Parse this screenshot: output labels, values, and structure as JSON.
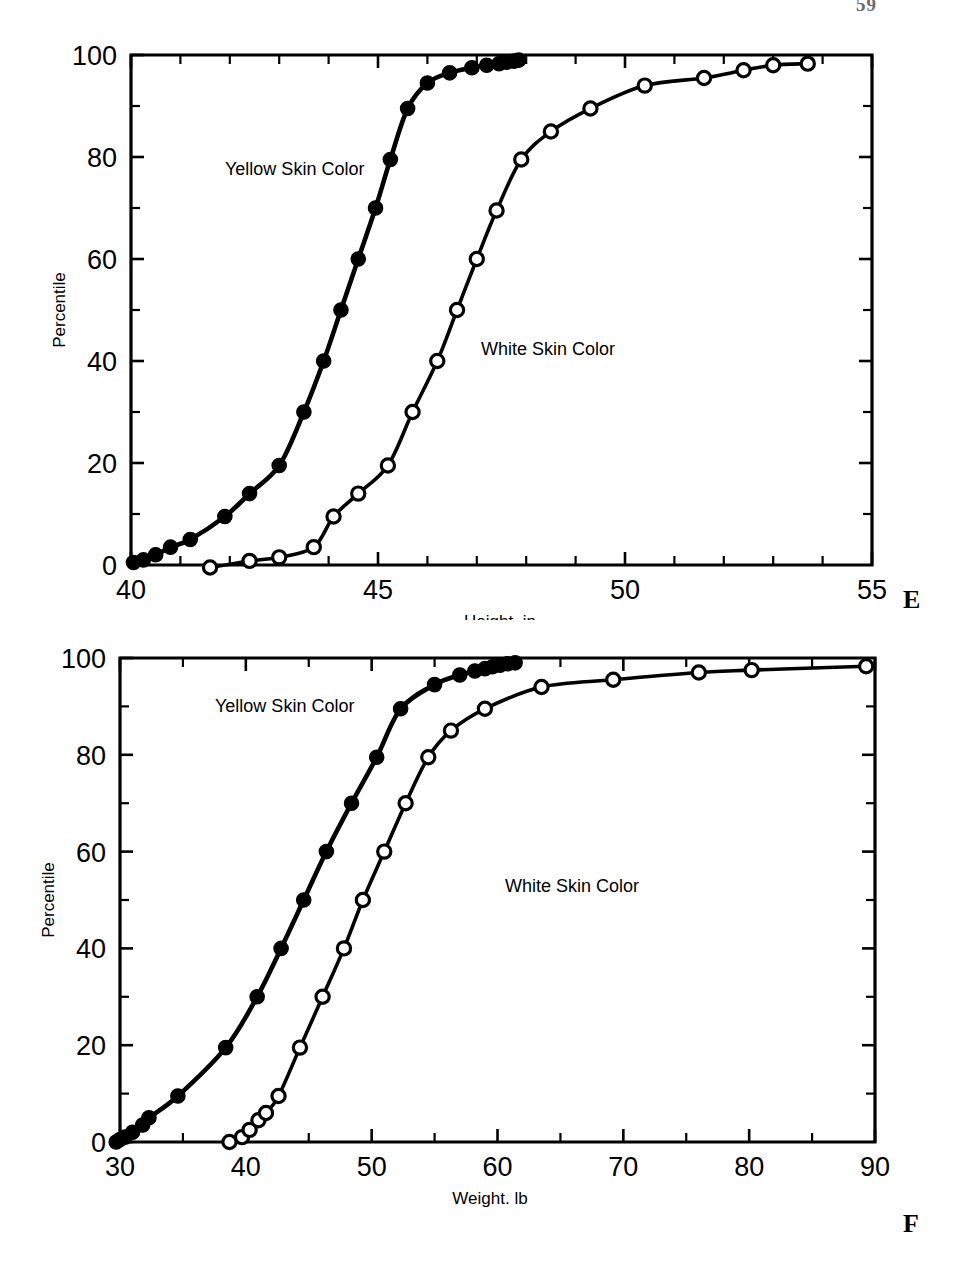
{
  "page": {
    "number": "59",
    "background": "#ffffff",
    "ink": "#000000"
  },
  "panels": [
    {
      "letter": "E",
      "axis_title_x": "Height, in",
      "axis_title_y": "Percentile",
      "label_yellow": "Yellow Skin Color",
      "label_white": "White Skin Color"
    },
    {
      "letter": "F",
      "axis_title_x": "Weight. lb",
      "axis_title_y": "Percentile",
      "label_yellow": "Yellow Skin Color",
      "label_white": "White Skin Color"
    }
  ],
  "chart_data": [
    {
      "type": "line",
      "title": "",
      "panel": "E",
      "xlabel": "Height, in",
      "ylabel": "Percentile",
      "xlim": [
        40,
        55
      ],
      "ylim": [
        0,
        100
      ],
      "xticks": [
        40,
        45,
        50,
        55
      ],
      "xtick_labels": [
        "40",
        "45",
        "50",
        "55"
      ],
      "x_minor_step": 1,
      "yticks": [
        0,
        20,
        40,
        60,
        80,
        100
      ],
      "ytick_labels": [
        "0",
        "20",
        "40",
        "60",
        "80",
        "100"
      ],
      "y_minor_step": 10,
      "grid": false,
      "legend_position": "inline-annotation",
      "series": [
        {
          "name": "Yellow Skin Color",
          "marker": "filled-circle",
          "x": [
            40.05,
            40.25,
            40.5,
            40.8,
            41.2,
            41.9,
            42.4,
            43.0,
            43.5,
            43.9,
            44.25,
            44.6,
            44.95,
            45.25,
            45.6,
            46.0,
            46.45,
            46.9,
            47.2,
            47.45,
            47.6,
            47.75,
            47.85
          ],
          "y": [
            0.5,
            1,
            2,
            3.5,
            5,
            9.5,
            14,
            19.5,
            30,
            40,
            50,
            60,
            70,
            79.5,
            89.5,
            94.5,
            96.5,
            97.5,
            98,
            98.3,
            98.6,
            98.8,
            99
          ]
        },
        {
          "name": "White Skin Color",
          "marker": "open-circle",
          "x": [
            41.6,
            42.4,
            43.0,
            43.7,
            44.1,
            44.6,
            45.2,
            45.7,
            46.2,
            46.6,
            47.0,
            47.4,
            47.9,
            48.5,
            49.3,
            50.4,
            51.6,
            52.4,
            53.0,
            53.7
          ],
          "y": [
            -0.5,
            0.8,
            1.5,
            3.5,
            9.5,
            14,
            19.5,
            30,
            40,
            50,
            60,
            69.5,
            79.5,
            85,
            89.5,
            94,
            95.5,
            97,
            98,
            98.3
          ]
        }
      ]
    },
    {
      "type": "line",
      "title": "",
      "panel": "F",
      "xlabel": "Weight. lb",
      "ylabel": "Percentile",
      "xlim": [
        30,
        90
      ],
      "ylim": [
        0,
        100
      ],
      "xticks": [
        30,
        40,
        50,
        60,
        70,
        80,
        90
      ],
      "xtick_labels": [
        "30",
        "40",
        "50",
        "60",
        "70",
        "80",
        "90"
      ],
      "x_minor_step": 5,
      "yticks": [
        0,
        20,
        40,
        60,
        80,
        100
      ],
      "ytick_labels": [
        "0",
        "20",
        "40",
        "60",
        "80",
        "100"
      ],
      "y_minor_step": 10,
      "grid": false,
      "legend_position": "inline-annotation",
      "series": [
        {
          "name": "Yellow Skin Color",
          "marker": "filled-circle",
          "x": [
            29.7,
            30.0,
            30.4,
            31.0,
            31.8,
            32.3,
            34.6,
            38.4,
            40.9,
            42.8,
            44.6,
            46.4,
            48.4,
            50.4,
            52.3,
            55.0,
            57.0,
            58.2,
            59.0,
            59.6,
            60.2,
            60.8,
            61.4
          ],
          "y": [
            0,
            0.5,
            1,
            2,
            3.5,
            5,
            9.5,
            19.5,
            30,
            40,
            50,
            60,
            70,
            79.5,
            89.5,
            94.5,
            96.5,
            97.3,
            97.8,
            98.2,
            98.5,
            98.8,
            99
          ]
        },
        {
          "name": "White Skin Color",
          "marker": "open-circle",
          "x": [
            38.7,
            39.7,
            40.3,
            41.0,
            41.6,
            42.6,
            44.3,
            46.1,
            47.8,
            49.3,
            51.0,
            52.7,
            54.5,
            56.3,
            59.0,
            63.5,
            69.2,
            76.0,
            80.2,
            89.3
          ],
          "y": [
            0,
            1,
            2.5,
            4.5,
            6,
            9.5,
            19.5,
            30,
            40,
            50,
            60,
            70,
            79.5,
            85,
            89.5,
            94,
            95.5,
            97,
            97.5,
            98.3
          ]
        }
      ]
    }
  ]
}
